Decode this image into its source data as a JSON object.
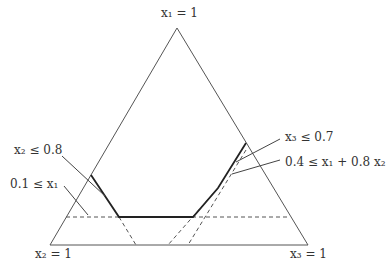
{
  "diagram": {
    "type": "ternary-feasible-region",
    "vertices": {
      "top": "x₁ = 1",
      "bottom_left": "x₂ = 1",
      "bottom_right": "x₃ = 1"
    },
    "constraints": [
      {
        "label": "x₂ ≤ 0.8",
        "side": "left"
      },
      {
        "label": "0.1 ≤ x₁",
        "side": "left"
      },
      {
        "label": "x₃ ≤ 0.7",
        "side": "right"
      },
      {
        "label": "0.4 ≤ x₁ + 0.8 x₂",
        "side": "right"
      }
    ],
    "colors": {
      "line": "#444444",
      "bold": "#222222",
      "background": "#ffffff"
    }
  }
}
